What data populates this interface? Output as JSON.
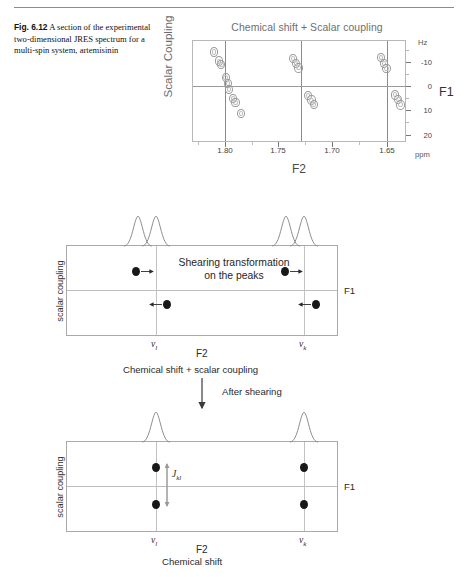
{
  "caption": {
    "fig_number": "Fig. 6.12",
    "text": "A section of the experimental two-dimensional JRES spectrum for a multi-spin system, artemisinin"
  },
  "spectrum": {
    "title": "Chemical shift + Scalar coupling",
    "xlabel": "F2",
    "ylabel": "Scalar Coupling",
    "right_axis_label": "F1",
    "y_unit": "Hz",
    "x_unit": "ppm",
    "x_ticks": [
      "1.80",
      "1.75",
      "1.70",
      "1.65"
    ],
    "y_ticks": [
      "-10",
      "0",
      "10",
      "20"
    ]
  },
  "chart_data": {
    "type": "scatter",
    "title": "Chemical shift + Scalar coupling",
    "xlabel": "F2",
    "ylabel": "Scalar Coupling",
    "x_unit": "ppm",
    "y_unit": "Hz",
    "xlim": [
      1.826,
      1.629
    ],
    "ylim": [
      -17.5,
      21.0
    ],
    "x_ticks": [
      1.8,
      1.75,
      1.7,
      1.65
    ],
    "y_ticks": [
      -10,
      0,
      10,
      20
    ],
    "grid": false,
    "legend": null,
    "note": "Tilted JRES multiplets; each cross-peak drawn as a small contour ellipse. Vertical guide lines mark the three chemical-shift centres.",
    "chemical_shift_lines_ppm": [
      1.793,
      1.724,
      1.645
    ],
    "series": [
      {
        "name": "multiplet-1",
        "points": [
          {
            "x": 1.806,
            "y": -13.0
          },
          {
            "x": 1.801,
            "y": -9.5
          },
          {
            "x": 1.799,
            "y": -8.2
          },
          {
            "x": 1.795,
            "y": -3.4
          },
          {
            "x": 1.793,
            "y": -1.0
          },
          {
            "x": 1.792,
            "y": 1.2
          },
          {
            "x": 1.788,
            "y": 4.6
          },
          {
            "x": 1.786,
            "y": 6.0
          },
          {
            "x": 1.781,
            "y": 10.2
          }
        ]
      },
      {
        "name": "multiplet-2",
        "points": [
          {
            "x": 1.733,
            "y": -10.6
          },
          {
            "x": 1.73,
            "y": -8.6
          },
          {
            "x": 1.728,
            "y": -7.0
          },
          {
            "x": 1.719,
            "y": 3.4
          },
          {
            "x": 1.716,
            "y": 5.2
          },
          {
            "x": 1.714,
            "y": 6.8
          }
        ]
      },
      {
        "name": "multiplet-3",
        "points": [
          {
            "x": 1.652,
            "y": -11.0
          },
          {
            "x": 1.649,
            "y": -8.6
          },
          {
            "x": 1.647,
            "y": -6.8
          },
          {
            "x": 1.639,
            "y": 3.2
          },
          {
            "x": 1.636,
            "y": 5.0
          },
          {
            "x": 1.634,
            "y": 7.0
          }
        ]
      }
    ]
  },
  "panel_top": {
    "ylabel": "scalar coupling",
    "xlabel": "F2",
    "right_label": "F1",
    "annotation_line1": "Shearing transformation",
    "annotation_line2": "on the peaks",
    "tick_left": "ν",
    "tick_left_sub": "l",
    "tick_right": "ν",
    "tick_right_sub": "k",
    "sub_caption": "Chemical shift + scalar coupling"
  },
  "arrow_label": "After shearing",
  "panel_bottom": {
    "ylabel": "scalar coupling",
    "xlabel": "F2",
    "right_label": "F1",
    "coupling_label": "J",
    "coupling_label_sub": "kl",
    "tick_left": "ν",
    "tick_left_sub": "l",
    "tick_right": "ν",
    "tick_right_sub": "k",
    "sub_caption": "Chemical shift"
  }
}
